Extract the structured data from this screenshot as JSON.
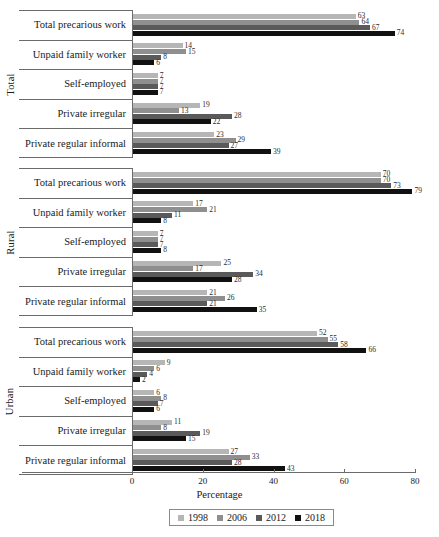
{
  "chart_data": {
    "type": "bar",
    "orientation": "horizontal",
    "title": "",
    "xlabel": "Percentage",
    "ylabel": "",
    "xlim": [
      0,
      80
    ],
    "xticks": [
      0,
      20,
      40,
      60,
      80
    ],
    "grid": false,
    "legend_position": "bottom",
    "series_names": [
      "1998",
      "2006",
      "2012",
      "2018"
    ],
    "series_colors": [
      "#b6b6b6",
      "#8f8f8f",
      "#5a5a5a",
      "#111111"
    ],
    "categories": [
      "Total precarious work",
      "Unpaid family worker",
      "Self-employed",
      "Private irregular",
      "Private regular informal"
    ],
    "panels": [
      {
        "name": "Total",
        "rows": [
          {
            "category": "Total precarious work",
            "values": [
              63,
              64,
              67,
              74
            ]
          },
          {
            "category": "Unpaid family worker",
            "values": [
              14,
              15,
              8,
              6
            ]
          },
          {
            "category": "Self-employed",
            "values": [
              7,
              7,
              7,
              7
            ]
          },
          {
            "category": "Private irregular",
            "values": [
              19,
              13,
              28,
              22
            ]
          },
          {
            "category": "Private regular informal",
            "values": [
              23,
              29,
              27,
              39
            ]
          }
        ]
      },
      {
        "name": "Rural",
        "rows": [
          {
            "category": "Total precarious work",
            "values": [
              70,
              70,
              73,
              79
            ]
          },
          {
            "category": "Unpaid family worker",
            "values": [
              17,
              21,
              11,
              8
            ]
          },
          {
            "category": "Self-employed",
            "values": [
              7,
              7,
              7,
              8
            ]
          },
          {
            "category": "Private irregular",
            "values": [
              25,
              17,
              34,
              28
            ]
          },
          {
            "category": "Private regular informal",
            "values": [
              21,
              26,
              21,
              35
            ]
          }
        ]
      },
      {
        "name": "Urban",
        "rows": [
          {
            "category": "Total precarious work",
            "values": [
              52,
              55,
              58,
              66
            ]
          },
          {
            "category": "Unpaid family worker",
            "values": [
              9,
              6,
              4,
              2
            ]
          },
          {
            "category": "Self-employed",
            "values": [
              6,
              8,
              7,
              6
            ]
          },
          {
            "category": "Private irregular",
            "values": [
              11,
              8,
              19,
              15
            ]
          },
          {
            "category": "Private regular informal",
            "values": [
              27,
              33,
              28,
              43
            ]
          }
        ]
      }
    ]
  },
  "axis": {
    "xtitle": "Percentage",
    "ticks": [
      "0",
      "20",
      "40",
      "60",
      "80"
    ]
  },
  "legend": {
    "items": [
      {
        "label": "1998",
        "color": "#b6b6b6"
      },
      {
        "label": "2006",
        "color": "#8f8f8f"
      },
      {
        "label": "2012",
        "color": "#5a5a5a"
      },
      {
        "label": "2018",
        "color": "#111111"
      }
    ]
  }
}
